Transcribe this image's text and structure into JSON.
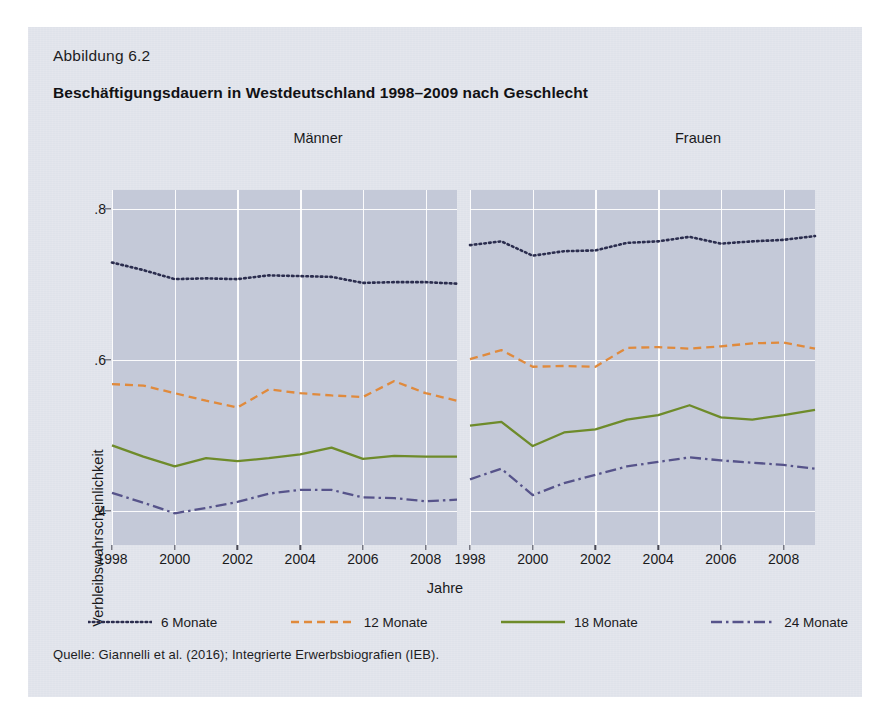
{
  "figure": {
    "number_label": "Abbildung 6.2",
    "title": "Beschäftigungsdauern in Westdeutschland 1998–2009 nach Geschlecht",
    "source": "Quelle: Giannelli et al. (2016); Integrierte Erwerbsbiografien (IEB).",
    "background_color": "#dfe2ea",
    "plot_background_color": "#c4c9d8",
    "grid_color": "#ffffff"
  },
  "chart_data": {
    "type": "line",
    "title": "Beschäftigungsdauern in Westdeutschland 1998–2009 nach Geschlecht",
    "xlabel": "Jahre",
    "ylabel": "Verbleibswahrscheinlichkeit",
    "grid": true,
    "legend_position": "bottom",
    "ylim": [
      0.355,
      0.825
    ],
    "yticks": [
      0.4,
      0.6,
      0.8
    ],
    "ytick_labels": [
      ".4",
      ".6",
      ".8"
    ],
    "xlim": [
      1998,
      2009
    ],
    "xticks": [
      1998,
      2000,
      2002,
      2004,
      2006,
      2008
    ],
    "xtick_labels": [
      "1998",
      "2000",
      "2002",
      "2004",
      "2006",
      "2008"
    ],
    "x": [
      1998,
      1999,
      2000,
      2001,
      2002,
      2003,
      2004,
      2005,
      2006,
      2007,
      2008,
      2009
    ],
    "panels": [
      {
        "name": "Männer",
        "title": "Männer",
        "series": [
          {
            "name": "6 Monate",
            "color": "#2b2d4e",
            "dash": "dotted",
            "values": [
              0.729,
              0.719,
              0.707,
              0.708,
              0.707,
              0.712,
              0.711,
              0.71,
              0.702,
              0.703,
              0.703,
              0.701
            ]
          },
          {
            "name": "12 Monate",
            "color": "#e08a3c",
            "dash": "dashed",
            "values": [
              0.568,
              0.566,
              0.556,
              0.546,
              0.537,
              0.561,
              0.556,
              0.553,
              0.551,
              0.572,
              0.556,
              0.546
            ]
          },
          {
            "name": "18 Monate",
            "color": "#6e8b2a",
            "dash": "solid",
            "values": [
              0.487,
              0.472,
              0.459,
              0.47,
              0.466,
              0.47,
              0.475,
              0.484,
              0.469,
              0.473,
              0.472,
              0.472
            ]
          },
          {
            "name": "24 Monate",
            "color": "#56538a",
            "dash": "dashdot",
            "values": [
              0.424,
              0.411,
              0.397,
              0.404,
              0.412,
              0.423,
              0.428,
              0.428,
              0.418,
              0.417,
              0.413,
              0.415
            ]
          }
        ]
      },
      {
        "name": "Frauen",
        "title": "Frauen",
        "series": [
          {
            "name": "6 Monate",
            "color": "#2b2d4e",
            "dash": "dotted",
            "values": [
              0.752,
              0.757,
              0.738,
              0.744,
              0.745,
              0.755,
              0.757,
              0.763,
              0.754,
              0.757,
              0.759,
              0.764
            ]
          },
          {
            "name": "12 Monate",
            "color": "#e08a3c",
            "dash": "dashed",
            "values": [
              0.601,
              0.613,
              0.591,
              0.592,
              0.591,
              0.616,
              0.617,
              0.615,
              0.618,
              0.622,
              0.623,
              0.615
            ]
          },
          {
            "name": "18 Monate",
            "color": "#6e8b2a",
            "dash": "solid",
            "values": [
              0.513,
              0.518,
              0.486,
              0.504,
              0.508,
              0.521,
              0.527,
              0.54,
              0.524,
              0.521,
              0.527,
              0.534
            ]
          },
          {
            "name": "24 Monate",
            "color": "#56538a",
            "dash": "dashdot",
            "values": [
              0.442,
              0.456,
              0.421,
              0.437,
              0.448,
              0.459,
              0.465,
              0.471,
              0.467,
              0.464,
              0.461,
              0.456
            ]
          }
        ]
      }
    ],
    "legend": [
      {
        "label": "6 Monate",
        "color": "#2b2d4e",
        "dash": "dotted"
      },
      {
        "label": "12 Monate",
        "color": "#e08a3c",
        "dash": "dashed"
      },
      {
        "label": "18 Monate",
        "color": "#6e8b2a",
        "dash": "solid"
      },
      {
        "label": "24 Monate",
        "color": "#56538a",
        "dash": "dashdot"
      }
    ]
  }
}
